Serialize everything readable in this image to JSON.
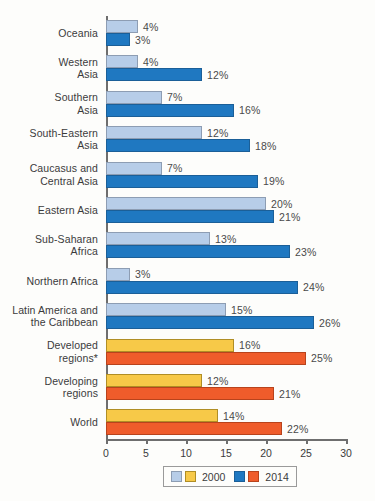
{
  "chart_data": {
    "type": "bar",
    "orientation": "horizontal",
    "title": "",
    "xlabel": "",
    "ylabel": "",
    "xlim": [
      0,
      30
    ],
    "xticks": [
      0,
      5,
      10,
      15,
      20,
      25,
      30
    ],
    "grid": false,
    "legend_position": "bottom",
    "value_suffix": "%",
    "categories": [
      "Oceania",
      "Western Asia",
      "Southern Asia",
      "South-Eastern Asia",
      "Caucasus and Central Asia",
      "Eastern Asia",
      "Sub-Saharan Africa",
      "Northern Africa",
      "Latin America and the Caribbean",
      "Developed regions*",
      "Developing regions",
      "World"
    ],
    "series": [
      {
        "name": "2000",
        "values": [
          4,
          4,
          7,
          12,
          7,
          20,
          13,
          3,
          15,
          16,
          12,
          14
        ],
        "labels": [
          "4%",
          "4%",
          "7%",
          "12%",
          "7%",
          "20%",
          "13%",
          "3%",
          "15%",
          "16%",
          "12%",
          "14%"
        ]
      },
      {
        "name": "2014",
        "values": [
          3,
          12,
          16,
          18,
          19,
          21,
          23,
          24,
          26,
          25,
          21,
          22
        ],
        "labels": [
          "3%",
          "12%",
          "16%",
          "18%",
          "19%",
          "21%",
          "23%",
          "24%",
          "26%",
          "25%",
          "21%",
          "22%"
        ]
      }
    ]
  },
  "rows": [
    {
      "label_lines": [
        "Oceania"
      ],
      "palette": "blue",
      "v2000": 4,
      "l2000": "4%",
      "v2014": 3,
      "l2014": "3%"
    },
    {
      "label_lines": [
        "Western",
        "Asia"
      ],
      "palette": "blue",
      "v2000": 4,
      "l2000": "4%",
      "v2014": 12,
      "l2014": "12%"
    },
    {
      "label_lines": [
        "Southern",
        "Asia"
      ],
      "palette": "blue",
      "v2000": 7,
      "l2000": "7%",
      "v2014": 16,
      "l2014": "16%"
    },
    {
      "label_lines": [
        "South-Eastern",
        "Asia"
      ],
      "palette": "blue",
      "v2000": 12,
      "l2000": "12%",
      "v2014": 18,
      "l2014": "18%"
    },
    {
      "label_lines": [
        "Caucasus and",
        "Central Asia"
      ],
      "palette": "blue",
      "v2000": 7,
      "l2000": "7%",
      "v2014": 19,
      "l2014": "19%"
    },
    {
      "label_lines": [
        "Eastern Asia"
      ],
      "palette": "blue",
      "v2000": 20,
      "l2000": "20%",
      "v2014": 21,
      "l2014": "21%"
    },
    {
      "label_lines": [
        "Sub-Saharan",
        "Africa"
      ],
      "palette": "blue",
      "v2000": 13,
      "l2000": "13%",
      "v2014": 23,
      "l2014": "23%"
    },
    {
      "label_lines": [
        "Northern Africa"
      ],
      "palette": "blue",
      "v2000": 3,
      "l2000": "3%",
      "v2014": 24,
      "l2014": "24%"
    },
    {
      "label_lines": [
        "Latin America and",
        "the Caribbean"
      ],
      "palette": "blue",
      "v2000": 15,
      "l2000": "15%",
      "v2014": 26,
      "l2014": "26%"
    },
    {
      "label_lines": [
        "Developed",
        "regions*"
      ],
      "palette": "yellow",
      "v2000": 16,
      "l2000": "16%",
      "v2014": 25,
      "l2014": "25%"
    },
    {
      "label_lines": [
        "Developing",
        "regions"
      ],
      "palette": "yellow",
      "v2000": 12,
      "l2000": "12%",
      "v2014": 21,
      "l2014": "21%"
    },
    {
      "label_lines": [
        "World"
      ],
      "palette": "yellow",
      "v2000": 14,
      "l2000": "14%",
      "v2014": 22,
      "l2014": "22%"
    }
  ],
  "axis": {
    "ticks": [
      "0",
      "5",
      "10",
      "15",
      "20",
      "25",
      "30"
    ]
  },
  "legend": {
    "entries": [
      {
        "label": "2000",
        "swatches": [
          "lblue",
          "yellow"
        ]
      },
      {
        "label": "2014",
        "swatches": [
          "blue",
          "orange"
        ]
      }
    ]
  },
  "colors": {
    "series_2000_blue": "#b7cde8",
    "series_2014_blue": "#1f78c1",
    "series_2000_yellow": "#f7c948",
    "series_2014_yellow": "#ef5c2b",
    "axis": "#6e6e6e",
    "text": "#3b3b3b",
    "background": "#fdfdfb"
  }
}
